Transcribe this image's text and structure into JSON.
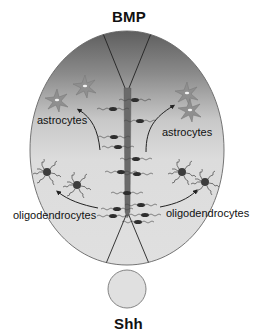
{
  "diagram": {
    "top_signal": "BMP",
    "bottom_signal": "Shh",
    "labels": {
      "astrocytes_left": "astrocytes",
      "astrocytes_right": "astrocytes",
      "oligodendrocytes_left": "oligodendrocytes",
      "oligodendrocytes_right": "oligodendrocytes"
    },
    "colors": {
      "gradient_top": "#6e6e6e",
      "gradient_mid": "#cfcfcf",
      "gradient_bottom": "#e2e2e2",
      "outline": "#555555",
      "central_bar": "#6a6a6a",
      "cell_body": "#3a3a3a",
      "shh_fill": "#e0e0e0"
    }
  }
}
